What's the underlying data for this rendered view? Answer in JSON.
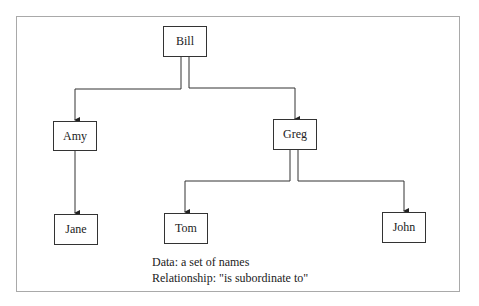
{
  "diagram": {
    "type": "hierarchy-tree",
    "nodes": {
      "bill": "Bill",
      "amy": "Amy",
      "greg": "Greg",
      "jane": "Jane",
      "tom": "Tom",
      "john": "John"
    },
    "edges": [
      {
        "from": "Bill",
        "to": "Amy"
      },
      {
        "from": "Bill",
        "to": "Greg"
      },
      {
        "from": "Amy",
        "to": "Jane"
      },
      {
        "from": "Greg",
        "to": "Tom"
      },
      {
        "from": "Greg",
        "to": "John"
      }
    ]
  },
  "caption": {
    "line1": "Data:  a set of names",
    "line2": "Relationship:  \"is subordinate to\""
  }
}
